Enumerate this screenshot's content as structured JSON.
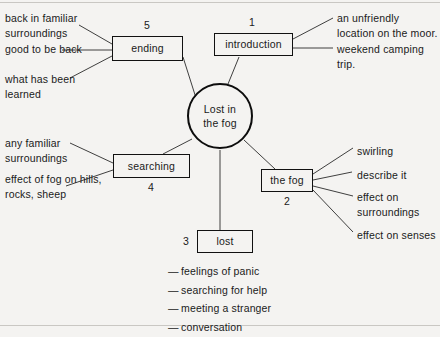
{
  "diagram": {
    "title": "Lost in the fog",
    "center": {
      "label_line1": "Lost in",
      "label_line2": "the fog",
      "name": "center-circle"
    },
    "nodes": [
      {
        "id": "introduction",
        "label": "introduction",
        "number": "1"
      },
      {
        "id": "the_fog",
        "label": "the fog",
        "number": "2"
      },
      {
        "id": "lost",
        "label": "lost",
        "number": "3"
      },
      {
        "id": "searching",
        "label": "searching",
        "number": "4"
      },
      {
        "id": "ending",
        "label": "ending",
        "number": "5"
      }
    ],
    "leaves": {
      "ending": [
        "back in familiar surroundings",
        "good to be back",
        "what has been learned"
      ],
      "introduction": [
        "an unfriendly location on the moor.",
        "weekend camping trip."
      ],
      "searching": [
        "any familiar surroundings",
        "effect of fog on hills, rocks, sheep"
      ],
      "the_fog": [
        "swirling",
        "describe it",
        "effect on surroundings",
        "effect on senses"
      ],
      "lost": [
        "feelings of panic",
        "searching for help",
        "meeting a stranger",
        "conversation"
      ]
    },
    "bullet_dash": "—",
    "colors": {
      "page_background": "#f4f3f1",
      "ink": "#1a1a1a",
      "line": "#2a2a2a",
      "rule": "#c9c7c3"
    }
  }
}
